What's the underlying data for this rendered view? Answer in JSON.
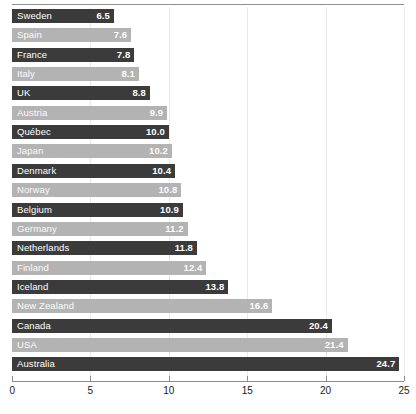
{
  "chart_data": {
    "type": "bar",
    "orientation": "horizontal",
    "title": "",
    "xlabel": "",
    "ylabel": "",
    "xlim": [
      0,
      25
    ],
    "xticks": [
      0,
      5,
      10,
      15,
      20,
      25
    ],
    "grid": true,
    "grid_axis": "x",
    "legend": "none",
    "categories": [
      "Sweden",
      "Spain",
      "France",
      "Italy",
      "UK",
      "Austria",
      "Québec",
      "Japan",
      "Denmark",
      "Norway",
      "Belgium",
      "Germany",
      "Netherlands",
      "Finland",
      "Iceland",
      "New Zealand",
      "Canada",
      "USA",
      "Australia"
    ],
    "values": [
      6.5,
      7.6,
      7.8,
      8.1,
      8.8,
      9.9,
      10.0,
      10.2,
      10.4,
      10.8,
      10.9,
      11.2,
      11.8,
      12.4,
      13.8,
      16.6,
      20.4,
      21.4,
      24.7
    ],
    "value_labels": [
      "6.5",
      "7.6",
      "7.8",
      "8.1",
      "8.8",
      "9.9",
      "10.0",
      "10.2",
      "10.4",
      "10.8",
      "10.9",
      "11.2",
      "11.8",
      "12.4",
      "13.8",
      "16.6",
      "20.4",
      "21.4",
      "24.7"
    ],
    "bar_styles": [
      "dark",
      "light",
      "dark",
      "light",
      "dark",
      "light",
      "dark",
      "light",
      "dark",
      "light",
      "dark",
      "light",
      "dark",
      "light",
      "dark",
      "light",
      "dark",
      "light",
      "dark"
    ],
    "colors": {
      "dark_bar": "#3b3b3b",
      "light_bar": "#b3b3b3",
      "label_text": "#ffffff",
      "axis": "#8b8b8b",
      "gridline": "#e9e9e9",
      "background": "#ffffff"
    }
  }
}
